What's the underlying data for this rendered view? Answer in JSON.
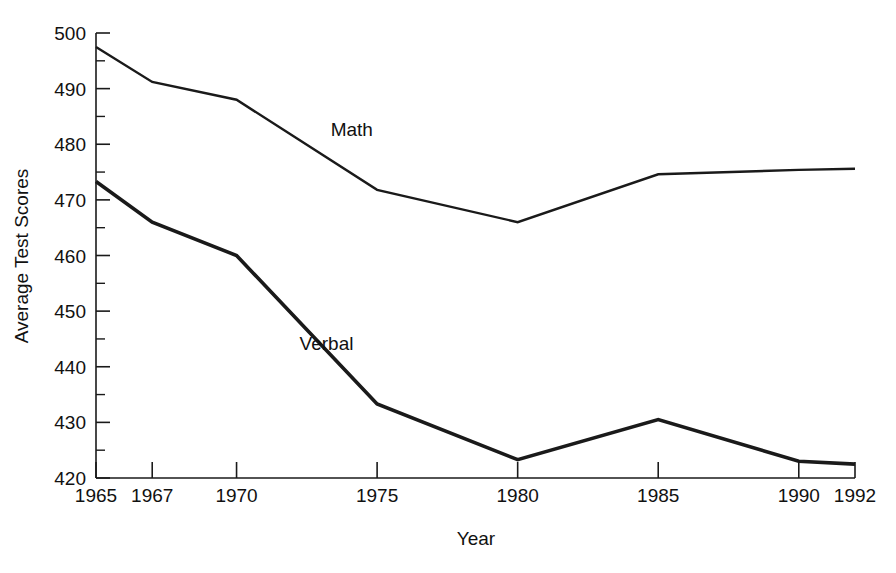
{
  "chart_data": {
    "type": "line",
    "title": "",
    "xlabel": "Year",
    "ylabel": "Average Test Scores",
    "x": [
      1965,
      1967,
      1970,
      1975,
      1980,
      1985,
      1990,
      1992
    ],
    "xlim": [
      1965,
      1992
    ],
    "ylim": [
      420,
      500
    ],
    "grid": false,
    "legend_position": "inline-annotation",
    "y_ticks_major": [
      420,
      430,
      440,
      450,
      460,
      470,
      480,
      490,
      500
    ],
    "y_ticks_minor": [
      425,
      435,
      445,
      455,
      465,
      475,
      485,
      495
    ],
    "x_ticks": [
      1965,
      1967,
      1970,
      1975,
      1980,
      1985,
      1990,
      1992
    ],
    "x_tick_labels": [
      "1965",
      "1967",
      "1970",
      "1975",
      "1980",
      "1985",
      "1990",
      "1992"
    ],
    "y_tick_labels": [
      "420",
      "430",
      "440",
      "450",
      "460",
      "470",
      "480",
      "490",
      "500"
    ],
    "series": [
      {
        "name": "Math",
        "values": [
          497.5,
          491.2,
          488.0,
          471.8,
          466.0,
          474.6,
          475.4,
          475.6
        ],
        "label_text": "Math",
        "label_x": 1974.1,
        "label_y": 481.5
      },
      {
        "name": "Verbal",
        "values": [
          473.3,
          466.0,
          460.0,
          433.3,
          423.3,
          430.5,
          423.0,
          422.5
        ],
        "label_text": "Verbal",
        "label_x": 1973.2,
        "label_y": 443.0
      }
    ]
  },
  "axes": {
    "x_axis_title": "Year",
    "y_axis_title": "Average Test Scores"
  },
  "colors": {
    "line": "#1a1a1a",
    "text": "#111111",
    "background": "#ffffff"
  }
}
